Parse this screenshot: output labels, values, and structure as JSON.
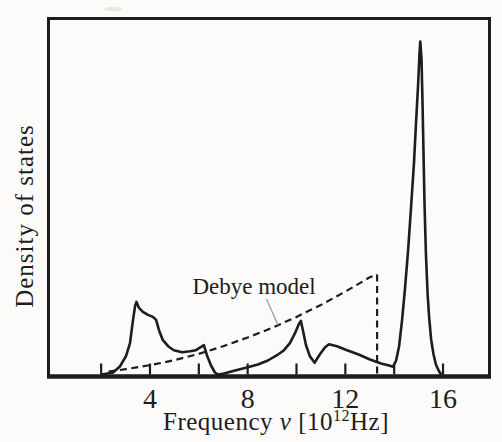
{
  "figure": {
    "background": "#fcfbf9",
    "ink_color": "#1d1d1d",
    "pointer_color": "#a6a6a2"
  },
  "chart_data": {
    "type": "line",
    "title": "",
    "xlabel": "Frequency ν [10¹²Hz]",
    "xlabel_parts": {
      "prefix": "Frequency ",
      "symbol": "ν",
      "unit_open": " [10",
      "superscript": "12",
      "unit_close": "Hz]"
    },
    "ylabel": "Density of states",
    "annotation": "Debye model",
    "x_major_ticks": [
      4,
      8,
      12,
      16
    ],
    "x_minor_ticks": [
      2,
      6,
      10,
      14
    ],
    "xlim": [
      -0.2,
      17.9
    ],
    "ylim": [
      0,
      1.07
    ],
    "grid": false,
    "legend": "none",
    "y_axis_numbers": "none (arbitrary units)",
    "series": [
      {
        "name": "phonon_density_of_states",
        "style": "solid",
        "points": [
          [
            2.03,
            0.0
          ],
          [
            2.49,
            0.006
          ],
          [
            2.77,
            0.024
          ],
          [
            3.02,
            0.055
          ],
          [
            3.18,
            0.094
          ],
          [
            3.3,
            0.161
          ],
          [
            3.39,
            0.206
          ],
          [
            3.45,
            0.218
          ],
          [
            3.55,
            0.2
          ],
          [
            3.71,
            0.188
          ],
          [
            3.92,
            0.179
          ],
          [
            4.12,
            0.173
          ],
          [
            4.25,
            0.164
          ],
          [
            4.37,
            0.133
          ],
          [
            4.53,
            0.103
          ],
          [
            4.74,
            0.085
          ],
          [
            4.98,
            0.073
          ],
          [
            5.31,
            0.067
          ],
          [
            5.64,
            0.07
          ],
          [
            5.88,
            0.073
          ],
          [
            6.21,
            0.088
          ],
          [
            6.33,
            0.058
          ],
          [
            6.5,
            0.027
          ],
          [
            6.66,
            0.006
          ],
          [
            6.79,
            0.0
          ],
          [
            7.03,
            0.003
          ],
          [
            7.48,
            0.012
          ],
          [
            7.97,
            0.021
          ],
          [
            8.42,
            0.03
          ],
          [
            8.83,
            0.042
          ],
          [
            9.2,
            0.058
          ],
          [
            9.49,
            0.073
          ],
          [
            9.73,
            0.094
          ],
          [
            9.94,
            0.124
          ],
          [
            10.1,
            0.152
          ],
          [
            10.18,
            0.161
          ],
          [
            10.27,
            0.13
          ],
          [
            10.39,
            0.088
          ],
          [
            10.55,
            0.055
          ],
          [
            10.74,
            0.035
          ],
          [
            10.96,
            0.061
          ],
          [
            11.17,
            0.082
          ],
          [
            11.33,
            0.091
          ],
          [
            11.66,
            0.085
          ],
          [
            12.07,
            0.073
          ],
          [
            12.52,
            0.061
          ],
          [
            13.01,
            0.045
          ],
          [
            13.46,
            0.033
          ],
          [
            13.79,
            0.027
          ],
          [
            13.95,
            0.023
          ],
          [
            14.08,
            0.042
          ],
          [
            14.2,
            0.085
          ],
          [
            14.32,
            0.161
          ],
          [
            14.44,
            0.255
          ],
          [
            14.57,
            0.373
          ],
          [
            14.69,
            0.5
          ],
          [
            14.81,
            0.636
          ],
          [
            14.89,
            0.748
          ],
          [
            14.98,
            0.87
          ],
          [
            15.04,
            0.97
          ],
          [
            15.07,
            1.0
          ],
          [
            15.12,
            0.948
          ],
          [
            15.16,
            0.818
          ],
          [
            15.2,
            0.667
          ],
          [
            15.24,
            0.515
          ],
          [
            15.3,
            0.364
          ],
          [
            15.37,
            0.242
          ],
          [
            15.43,
            0.173
          ],
          [
            15.51,
            0.106
          ],
          [
            15.61,
            0.061
          ],
          [
            15.71,
            0.03
          ],
          [
            15.82,
            0.012
          ],
          [
            15.92,
            0.0
          ]
        ]
      },
      {
        "name": "debye_model",
        "style": "dashed",
        "cutoff_frequency": 13.3,
        "points": [
          [
            2.3,
            0.009
          ],
          [
            3,
            0.016
          ],
          [
            4,
            0.028
          ],
          [
            5,
            0.043
          ],
          [
            6,
            0.062
          ],
          [
            7,
            0.085
          ],
          [
            8,
            0.111
          ],
          [
            9,
            0.14
          ],
          [
            10,
            0.173
          ],
          [
            11,
            0.209
          ],
          [
            12,
            0.249
          ],
          [
            13,
            0.292
          ],
          [
            13.3,
            0.3
          ]
        ]
      }
    ],
    "debye_cutoff_line": {
      "x": 13.3,
      "y_top": 0.3,
      "y_bottom": 0.0
    },
    "annotation_pos": [
      8.26,
      0.242
    ],
    "annotation_pointer": {
      "from": [
        8.77,
        0.227
      ],
      "to": [
        9.24,
        0.149
      ]
    }
  }
}
